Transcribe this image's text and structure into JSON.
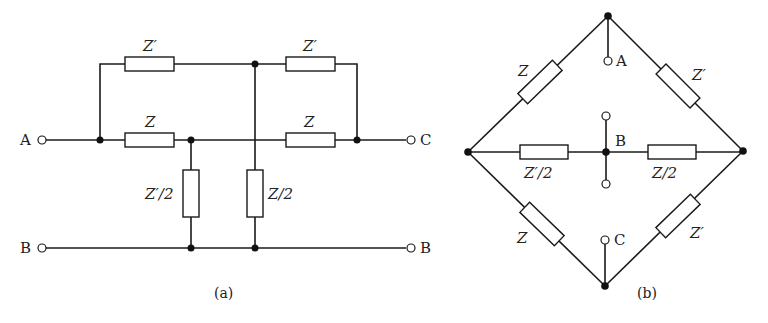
{
  "figure_a": {
    "caption": "(a)",
    "terminals": {
      "left_top": "A",
      "right_top": "C",
      "left_bottom": "B",
      "right_bottom": "B"
    },
    "components": {
      "top_left": "Z′",
      "top_right": "Z′",
      "mid_left": "Z",
      "mid_right": "Z",
      "shunt_left": "Z′/2",
      "shunt_right": "Z/2"
    }
  },
  "figure_b": {
    "caption": "(b)",
    "terminals": {
      "top": "A",
      "center": "B",
      "bottom": "C"
    },
    "components": {
      "upper_left": "Z",
      "upper_right": "Z′",
      "center_left": "Z′/2",
      "center_right": "Z/2",
      "lower_left": "Z",
      "lower_right": "Z′"
    }
  }
}
